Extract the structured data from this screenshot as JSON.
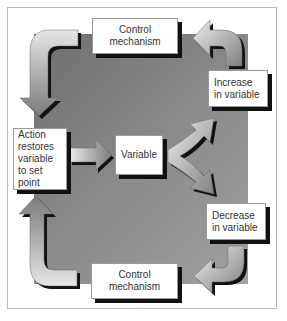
{
  "diagram": {
    "type": "negative-feedback-loop",
    "nodes": {
      "top_control": "Control mechanism",
      "increase": "Increase in variable",
      "action": "Action restores variable to set point",
      "variable": "Variable",
      "decrease": "Decrease in variable",
      "bottom_control": "Control mechanism"
    },
    "edges": [
      {
        "from": "variable",
        "to": "increase"
      },
      {
        "from": "variable",
        "to": "decrease"
      },
      {
        "from": "increase",
        "to": "top_control"
      },
      {
        "from": "top_control",
        "to": "action"
      },
      {
        "from": "decrease",
        "to": "bottom_control"
      },
      {
        "from": "bottom_control",
        "to": "action"
      },
      {
        "from": "action",
        "to": "variable"
      }
    ],
    "colors": {
      "background_square": "#8a8a8a",
      "box_fill": "#ffffff",
      "box_shadow": "#111111",
      "arrow_light": "#e8e8e8",
      "arrow_dark": "#7a7a7a",
      "frame_border": "#b8b8b8"
    }
  }
}
